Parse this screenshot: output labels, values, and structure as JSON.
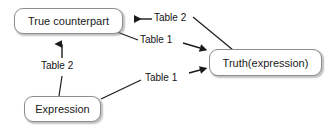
{
  "diagram": {
    "background_color": "#ffffff",
    "node_border_color": "#8d8d8d",
    "text_color": "#1b1b1b",
    "edge_color": "#222222",
    "nodes": [
      {
        "id": "true-counterpart",
        "label": "True counterpart",
        "x": 14,
        "y": 8,
        "width": 109,
        "height": 26,
        "font_size": 11
      },
      {
        "id": "truth-expression",
        "label": "Truth(expression)",
        "x": 209,
        "y": 49,
        "width": 113,
        "height": 27,
        "font_size": 11
      },
      {
        "id": "expression",
        "label": "Expression",
        "x": 24,
        "y": 96,
        "width": 77,
        "height": 26,
        "font_size": 11
      }
    ],
    "edges": [
      {
        "id": "edge-table2-truth-to-counterpart",
        "label": "Table 2",
        "from": "truth-expression",
        "to": "true-counterpart",
        "label_x": 154,
        "label_y": 13,
        "font_size": 10
      },
      {
        "id": "edge-table1-counterpart-to-truth",
        "label": "Table 1",
        "from": "true-counterpart",
        "to": "truth-expression",
        "label_x": 140,
        "label_y": 35,
        "font_size": 10
      },
      {
        "id": "edge-table2-expression-to-counterpart",
        "label": "Table 2",
        "from": "expression",
        "to": "true-counterpart",
        "label_x": 41,
        "label_y": 61,
        "font_size": 10
      },
      {
        "id": "edge-table1-expression-to-truth",
        "label": "Table 1",
        "from": "expression",
        "to": "truth-expression",
        "label_x": 145,
        "label_y": 73,
        "font_size": 10
      }
    ]
  }
}
